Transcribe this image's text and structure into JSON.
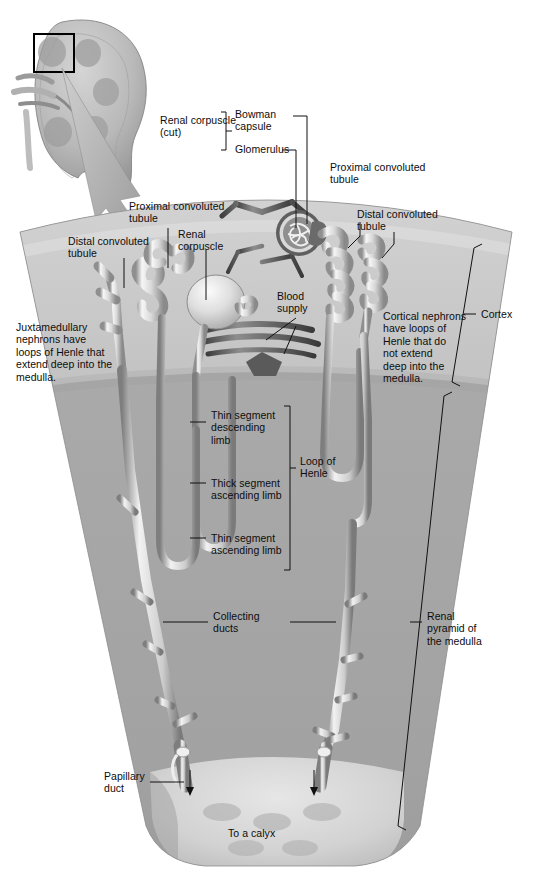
{
  "figure": {
    "regions": {
      "cortex_label": "Cortex",
      "medulla_label": "Renal\npyramid of\nthe medulla"
    },
    "colors": {
      "cortex_fill": "#c9c9c9",
      "medulla_fill": "#a8a8a8",
      "papilla_fill": "#d8d8d8",
      "tubule_light": "#f2f2f2",
      "tubule_mid": "#bdbdbd",
      "tubule_dark": "#6e6e6e",
      "vessel_dark": "#555555",
      "leader_line": "#111111",
      "text": "#0d0d0d",
      "page_background": "#ffffff"
    }
  },
  "inset": {
    "name": "kidney-coronal-section",
    "highlight_box": "black square outline on upper cortex region",
    "arrow": "tapered gray arrow pointing down-right to the wedge"
  },
  "labels": {
    "renal_corpuscle_cut": "Renal corpuscle\n(cut)",
    "bowman_capsule": "Bowman\ncapsule",
    "glomerulus": "Glomerulus",
    "proximal_convoluted_tubule_right": "Proximal convoluted\ntubule",
    "distal_convoluted_tubule_right": "Distal convoluted\ntubule",
    "proximal_convoluted_tubule_left": "Proximal convoluted\ntubule",
    "distal_convoluted_tubule_left": "Distal convoluted\ntubule",
    "renal_corpuscle_left": "Renal\ncorpuscle",
    "blood_supply": "Blood\nsupply",
    "juxtamedullary_note": "Juxtamedullary\nnephrons have\nloops of Henle that\nextend deep into the\nmedulla.",
    "cortical_note": "Cortical nephrons\nhave loops of\nHenle that do\nnot extend\ndeep into the\nmedulla.",
    "thin_segment_descending_limb": "Thin segment\ndescending\nlimb",
    "thick_segment_ascending_limb": "Thick segment\nascending limb",
    "thin_segment_ascending_limb": "Thin segment\nascending limb",
    "loop_of_henle": "Loop of\nHenle",
    "collecting_ducts": "Collecting\nducts",
    "papillary_duct": "Papillary\nduct",
    "to_a_calyx": "To a calyx",
    "cortex": "Cortex",
    "renal_pyramid_of_the_medulla": "Renal\npyramid of\nthe medulla"
  }
}
